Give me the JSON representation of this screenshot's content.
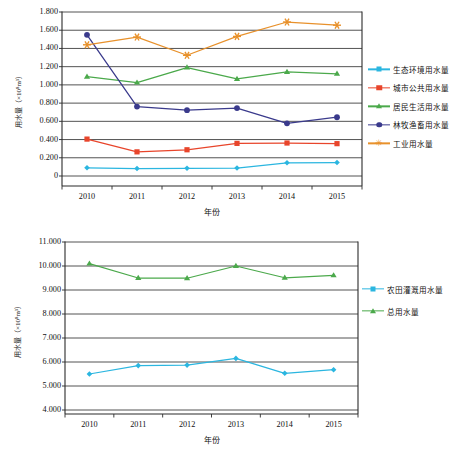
{
  "chart_data": [
    {
      "id": "top",
      "type": "line",
      "title": "",
      "xlabel": "年份",
      "ylabel": "用水量（×10⁸m³）",
      "categories": [
        "2010",
        "2011",
        "2012",
        "2013",
        "2014",
        "2015"
      ],
      "ylim": [
        0,
        1.8
      ],
      "yticks": [
        "0",
        "0.200",
        "0.400",
        "0.600",
        "0.800",
        "1.000",
        "1.200",
        "1.400",
        "1.600",
        "1.800"
      ],
      "ytick_values": [
        0,
        0.2,
        0.4,
        0.6,
        0.8,
        1.0,
        1.2,
        1.4,
        1.6,
        1.8
      ],
      "grid": true,
      "legend_position": "right",
      "series": [
        {
          "name": "生态环境用水量",
          "color": "#2BB6E0",
          "marker": "diamond",
          "values": [
            0.09,
            0.082,
            0.085,
            0.087,
            0.145,
            0.148
          ]
        },
        {
          "name": "城市公共用水量",
          "color": "#E8452B",
          "marker": "square",
          "values": [
            0.405,
            0.265,
            0.288,
            0.358,
            0.362,
            0.355
          ]
        },
        {
          "name": "居民生活用水量",
          "color": "#4BA94B",
          "marker": "triangle",
          "values": [
            1.09,
            1.025,
            1.19,
            1.065,
            1.142,
            1.122
          ]
        },
        {
          "name": "林牧渔畜用水量",
          "color": "#3A3A8C",
          "marker": "circle",
          "values": [
            1.55,
            0.762,
            0.722,
            0.745,
            0.578,
            0.645
          ]
        },
        {
          "name": "工业用水量",
          "color": "#E8912B",
          "marker": "star",
          "values": [
            1.44,
            1.525,
            1.325,
            1.532,
            1.69,
            1.655
          ]
        }
      ]
    },
    {
      "id": "bottom",
      "type": "line",
      "title": "",
      "xlabel": "年份",
      "ylabel": "用水量（×10⁸m³）",
      "categories": [
        "2010",
        "2011",
        "2012",
        "2013",
        "2014",
        "2015"
      ],
      "ylim": [
        4.0,
        11.0
      ],
      "yticks": [
        "4.000",
        "5.000",
        "6.000",
        "7.000",
        "8.000",
        "9.000",
        "10.000",
        "11.000"
      ],
      "ytick_values": [
        4,
        5,
        6,
        7,
        8,
        9,
        10,
        11
      ],
      "grid": true,
      "legend_position": "right",
      "series": [
        {
          "name": "农田灌溉用水量",
          "color": "#2BB6E0",
          "marker": "diamond",
          "values": [
            5.5,
            5.85,
            5.87,
            6.15,
            5.53,
            5.68
          ]
        },
        {
          "name": "总用水量",
          "color": "#4BA94B",
          "marker": "triangle",
          "values": [
            10.1,
            9.5,
            9.49,
            10.0,
            9.51,
            9.61
          ]
        }
      ]
    }
  ]
}
